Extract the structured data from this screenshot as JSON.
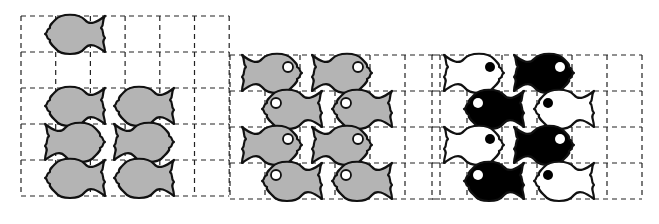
{
  "colors": {
    "grid": "#222222",
    "gray_fish": "#b4b4b4",
    "outline": "#111111",
    "black_fish": "#000000",
    "white_fish": "#ffffff"
  },
  "panels": [
    {
      "id": "single-fish-and-partial-tiling",
      "cols": 6,
      "rows": 5,
      "x": 21,
      "y": 16,
      "cell": 35
    },
    {
      "id": "gray-tiling-with-eyes",
      "cols": 6,
      "rows": 4,
      "x": 230,
      "y": 55,
      "cell": 35.5
    },
    {
      "id": "black-white-tiling",
      "cols": 6,
      "rows": 4,
      "x": 432,
      "y": 55,
      "cell": 35
    }
  ]
}
